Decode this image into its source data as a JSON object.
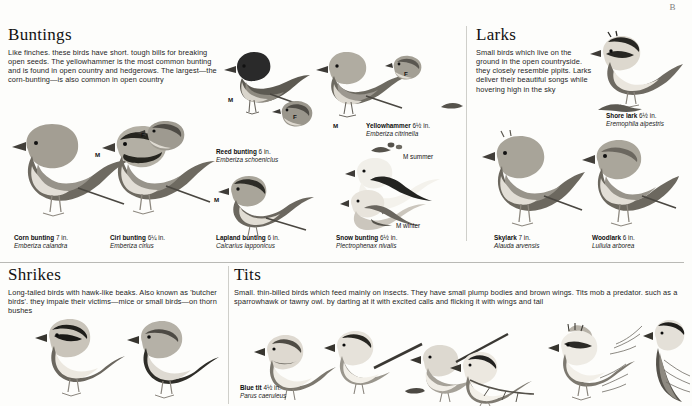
{
  "page": {
    "corner_mark": "B"
  },
  "sections": [
    {
      "id": "buntings",
      "title": "Buntings",
      "body": "Like finches. these birds have short. tough bills for breaking open seeds. The yellowhammer is the most common bunting and is found in open country and hedgerows. The largest—the corn-bunting—is also common in open country"
    },
    {
      "id": "larks",
      "title": "Larks",
      "body": "Small birds which live on the ground in the open countryside. they closely resemble pipits. Larks deliver their beautiful songs while hovering high in the sky"
    },
    {
      "id": "shrikes",
      "title": "Shrikes",
      "body": "Long-tailed birds with hawk-like beaks. Also known as 'butcher birds'. they impale their victims—mice or small birds—on thorn bushes"
    },
    {
      "id": "tits",
      "title": "Tits",
      "body": "Small. thin-billed birds which feed mainly on insects. They have small plump bodies and brown wings. Tits mob a predator. such as a sparrowhawk or tawny owl. by darting at it with excited calls and flicking it with wings and tail"
    }
  ],
  "captions": [
    {
      "id": "corn-bunting",
      "name": "Corn bunting",
      "size": "7 in.",
      "latin": "Emberiza calandra"
    },
    {
      "id": "cirl-bunting",
      "name": "Cirl bunting",
      "size": "6¼ in.",
      "latin": "Emberiza cirlus"
    },
    {
      "id": "reed-bunting",
      "name": "Reed bunting",
      "size": "6 in.",
      "latin": "Emberiza schoeniclus"
    },
    {
      "id": "yellowhammer",
      "name": "Yellowhammer",
      "size": "6½ in.",
      "latin": "Emberiza citrinella"
    },
    {
      "id": "lapland-bunting",
      "name": "Lapland bunting",
      "size": "6 in.",
      "latin": "Calcarius lapponicus"
    },
    {
      "id": "snow-bunting",
      "name": "Snow bunting",
      "size": "6½ in.",
      "latin": "Plectrophenax nivalis"
    },
    {
      "id": "shore-lark",
      "name": "Shore lark",
      "size": "6½ in.",
      "latin": "Eremophila alpestris"
    },
    {
      "id": "skylark",
      "name": "Skylark",
      "size": "7 in.",
      "latin": "Alauda arvensis"
    },
    {
      "id": "woodlark",
      "name": "Woodlark",
      "size": "6 in.",
      "latin": "Lullula arborea"
    },
    {
      "id": "blue-tit",
      "name": "Blue tit",
      "size": "4½ in.",
      "latin": "Parus caeruleus"
    }
  ],
  "tags": [
    {
      "id": "cirl-male",
      "label": "M"
    },
    {
      "id": "cirl-female",
      "label": "F"
    },
    {
      "id": "reed-male",
      "label": "M"
    },
    {
      "id": "reed-female",
      "label": "F"
    },
    {
      "id": "yellowhammer-male",
      "label": "M"
    },
    {
      "id": "yellowhammer-female",
      "label": "F"
    },
    {
      "id": "lapland-male",
      "label": "M"
    },
    {
      "id": "snow-male-summer",
      "label": "M summer"
    },
    {
      "id": "snow-male-winter",
      "label": "M winter"
    }
  ]
}
